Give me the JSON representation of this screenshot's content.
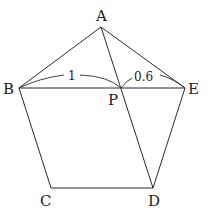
{
  "diagram": {
    "type": "geometry",
    "shape": "pentagon ABCDE with diagonals BE and AD intersecting at P",
    "points": {
      "A": {
        "label": "A",
        "x": 101,
        "y": 27
      },
      "B": {
        "label": "B",
        "x": 19,
        "y": 88
      },
      "C": {
        "label": "C",
        "x": 51,
        "y": 188
      },
      "D": {
        "label": "D",
        "x": 153,
        "y": 188
      },
      "E": {
        "label": "E",
        "x": 185,
        "y": 88
      },
      "P": {
        "label": "P",
        "x": 121,
        "y": 88
      }
    },
    "segments": [
      "AB",
      "AE",
      "BC",
      "CD",
      "DE",
      "BE",
      "AD"
    ],
    "measurements": {
      "BP": "1",
      "PE": "0.6"
    }
  }
}
